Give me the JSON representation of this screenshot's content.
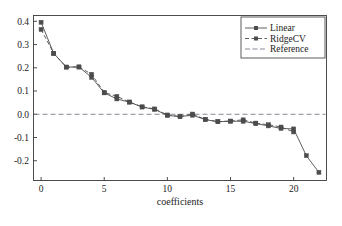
{
  "chart_data": {
    "type": "line",
    "title": "",
    "xlabel": "coefficients",
    "ylabel": "",
    "xlim": [
      -0.6,
      22.6
    ],
    "ylim": [
      -0.285,
      0.425
    ],
    "xticks": [
      0,
      5,
      10,
      15,
      20
    ],
    "xtick_labels": [
      "0",
      "5",
      "10",
      "15",
      "20"
    ],
    "yticks": [
      -0.2,
      -0.1,
      0.0,
      0.1,
      0.2,
      0.3,
      0.4
    ],
    "ytick_labels": [
      "-0.2",
      "-0.1",
      "0.0",
      "0.1",
      "0.2",
      "0.3",
      "0.4"
    ],
    "grid": false,
    "legend_position": "upper right",
    "x": [
      0,
      1,
      2,
      3,
      4,
      5,
      6,
      7,
      8,
      9,
      10,
      11,
      12,
      13,
      14,
      15,
      16,
      17,
      18,
      19,
      20,
      21,
      22
    ],
    "series": [
      {
        "name": "Linear",
        "style": "solid",
        "marker": "square",
        "color": "#4c4c4c",
        "values": [
          0.396,
          0.262,
          0.203,
          0.203,
          0.159,
          0.092,
          0.066,
          0.052,
          0.031,
          0.021,
          -0.005,
          -0.01,
          -0.004,
          -0.023,
          -0.032,
          -0.03,
          -0.03,
          -0.04,
          -0.05,
          -0.061,
          -0.063,
          -0.178,
          -0.25
        ]
      },
      {
        "name": "RidgeCV",
        "style": "dashed",
        "marker": "square",
        "color": "#4c4c4c",
        "values": [
          0.365,
          0.262,
          0.203,
          0.204,
          0.172,
          0.094,
          0.077,
          0.053,
          0.032,
          0.023,
          -0.003,
          -0.01,
          0.001,
          -0.022,
          -0.032,
          -0.029,
          -0.024,
          -0.038,
          -0.045,
          -0.055,
          -0.076,
          null,
          null
        ]
      }
    ],
    "reference": {
      "name": "Reference",
      "style": "dash-dot",
      "value": 0.0,
      "color": "#7a7a8c"
    }
  },
  "legend": {
    "entries": [
      {
        "label": "Linear"
      },
      {
        "label": "RidgeCV"
      },
      {
        "label": "Reference"
      }
    ]
  },
  "axis": {
    "xlabel": "coefficients"
  }
}
